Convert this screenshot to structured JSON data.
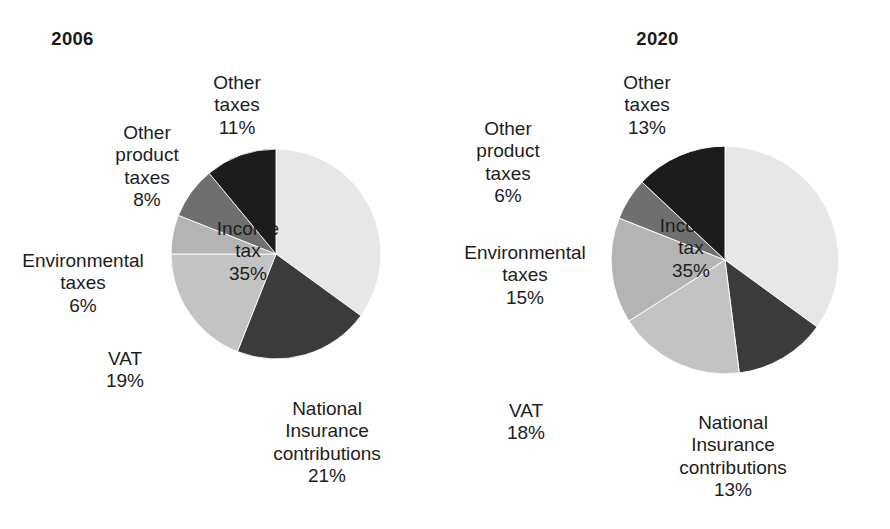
{
  "chart_data": [
    {
      "type": "pie",
      "title": "2006",
      "unit": "%",
      "start_angle_deg": 0,
      "direction": "clockwise",
      "categories": [
        "Income tax",
        "National Insurance contributions",
        "VAT",
        "Environmental taxes",
        "Other product taxes",
        "Other taxes"
      ],
      "values": [
        35,
        21,
        19,
        6,
        8,
        11
      ],
      "labels": [
        "Income\ntax\n35%",
        "National\nInsurance\ncontributions\n21%",
        "VAT\n19%",
        "Environmental\ntaxes\n6%",
        "Other\nproduct\ntaxes\n8%",
        "Other\ntaxes\n11%"
      ],
      "colors": [
        "#e7e7e7",
        "#3b3b3b",
        "#c3c3c3",
        "#b4b4b4",
        "#6f6f6f",
        "#1c1c1c"
      ],
      "legend": "none",
      "grid": false
    },
    {
      "type": "pie",
      "title": "2020",
      "unit": "%",
      "start_angle_deg": 0,
      "direction": "clockwise",
      "categories": [
        "Income tax",
        "National Insurance contributions",
        "VAT",
        "Environmental taxes",
        "Other product taxes",
        "Other taxes"
      ],
      "values": [
        35,
        13,
        18,
        15,
        6,
        13
      ],
      "labels": [
        "Income\ntax\n35%",
        "National\nInsurance\ncontributions\n13%",
        "VAT\n18%",
        "Environmental\ntaxes\n15%",
        "Other\nproduct\ntaxes\n6%",
        "Other\ntaxes\n13%"
      ],
      "colors": [
        "#e7e7e7",
        "#3b3b3b",
        "#c3c3c3",
        "#b4b4b4",
        "#6f6f6f",
        "#1c1c1c"
      ],
      "legend": "none",
      "grid": false
    }
  ],
  "charts": {
    "c2006": {
      "title": "2006",
      "income": "Income\ntax\n35%",
      "ni": "National\nInsurance\ncontributions\n21%",
      "vat": "VAT\n19%",
      "env": "Environmental\ntaxes\n6%",
      "product": "Other\nproduct\ntaxes\n8%",
      "other": "Other\ntaxes\n11%"
    },
    "c2020": {
      "title": "2020",
      "income": "Income\ntax\n35%",
      "ni": "National\nInsurance\ncontributions\n13%",
      "vat": "VAT\n18%",
      "env": "Environmental\ntaxes\n15%",
      "product": "Other\nproduct\ntaxes\n6%",
      "other": "Other\ntaxes\n13%"
    }
  }
}
